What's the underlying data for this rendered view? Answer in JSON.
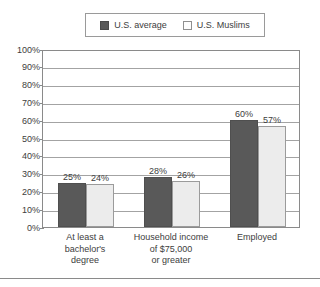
{
  "chart_data": {
    "type": "bar",
    "title": "",
    "subtitle": "",
    "xlabel": "",
    "ylabel": "",
    "ylim": [
      0,
      100
    ],
    "yunit": "%",
    "grid": true,
    "legend_position": "top-center",
    "categories": [
      "At least a\nbachelor's\ndegree",
      "Household income\nof $75,000\nor greater",
      "Employed"
    ],
    "category_lines": [
      [
        "At least a",
        "bachelor's",
        "degree"
      ],
      [
        "Household income",
        "of $75,000",
        "or greater"
      ],
      [
        "Employed"
      ]
    ],
    "series": [
      {
        "name": "U.S. average",
        "color": "#595959",
        "values": [
          25,
          28,
          60
        ],
        "labels": [
          "25%",
          "28%",
          "60%"
        ]
      },
      {
        "name": "U.S. Muslims",
        "color": "#ececec",
        "values": [
          24,
          26,
          57
        ],
        "labels": [
          "24%",
          "26%",
          "57%"
        ]
      }
    ],
    "yticks": [
      0,
      10,
      20,
      30,
      40,
      50,
      60,
      70,
      80,
      90,
      100
    ],
    "ytick_labels": [
      "0%",
      "10%",
      "20%",
      "30%",
      "40%",
      "50%",
      "60%",
      "70%",
      "80%",
      "90%",
      "100%"
    ]
  },
  "legend": {
    "entries": [
      {
        "label": "U.S. average",
        "swatch": "dark-swatch"
      },
      {
        "label": "U.S. Muslims",
        "swatch": "light-swatch"
      }
    ]
  },
  "axis": {
    "ytick_labels": [
      "100%",
      "90%",
      "80%",
      "70%",
      "60%",
      "50%",
      "40%",
      "30%",
      "20%",
      "10%",
      "0%"
    ]
  },
  "colors": {
    "series_dark": "#595959",
    "series_light": "#ececec",
    "gridline": "#a3a3a3",
    "frame": "#8a8a8a",
    "text": "#3d3d3d"
  }
}
